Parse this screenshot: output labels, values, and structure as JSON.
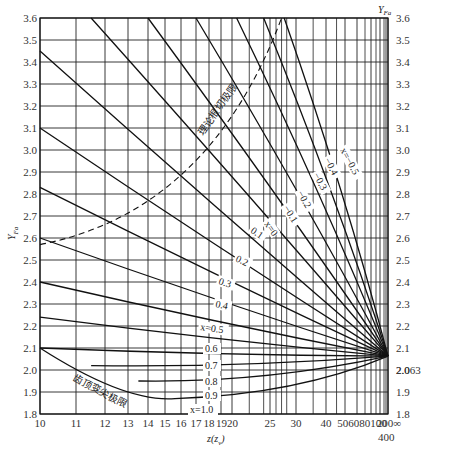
{
  "chart_data": {
    "type": "line",
    "title": "",
    "xlabel": "z(z_v)",
    "ylabel": "Y_Fa",
    "ylabel_right": "Y_Fa",
    "ylim": [
      1.8,
      3.6
    ],
    "yticks": [
      1.8,
      1.9,
      2.0,
      2.1,
      2.2,
      2.3,
      2.4,
      2.5,
      2.6,
      2.7,
      2.8,
      2.9,
      3.0,
      3.1,
      3.2,
      3.3,
      3.4,
      3.5,
      3.6
    ],
    "right_extra_tick": "2.063",
    "xticks": [
      {
        "label": "10",
        "x": 40
      },
      {
        "label": "11",
        "x": 76
      },
      {
        "label": "12",
        "x": 105
      },
      {
        "label": "13",
        "x": 128
      },
      {
        "label": "14",
        "x": 148
      },
      {
        "label": "15",
        "x": 165
      },
      {
        "label": "16",
        "x": 181
      },
      {
        "label": "17",
        "x": 196
      },
      {
        "label": "18",
        "x": 209
      },
      {
        "label": "19",
        "x": 221
      },
      {
        "label": "20",
        "x": 232
      },
      {
        "label": "25",
        "x": 270
      },
      {
        "label": "30",
        "x": 296
      },
      {
        "label": "40",
        "x": 326
      },
      {
        "label": "50",
        "x": 345
      },
      {
        "label": "60",
        "x": 357
      },
      {
        "label": "80",
        "x": 371
      },
      {
        "label": "100",
        "x": 380
      },
      {
        "label": "200",
        "x": 386
      },
      {
        "label": "∞",
        "x": 388
      }
    ],
    "xtick_labels_display": [
      "10",
      "11",
      "12",
      "13",
      "14",
      "15",
      "16",
      "17",
      "18",
      "1920",
      "25",
      "30",
      "40",
      "506080100",
      "200∞",
      "400"
    ],
    "grid": true,
    "convergence_point": {
      "z": "∞",
      "Y": 2.063
    },
    "series": [
      {
        "name": "x=-0.5",
        "start": {
          "z": 27.5,
          "Y": 3.6
        },
        "end": {
          "Y": 2.063
        }
      },
      {
        "name": "-0.4",
        "start": {
          "z": 24,
          "Y": 3.6
        },
        "end": {
          "Y": 2.063
        }
      },
      {
        "name": "-0.3",
        "start": {
          "z": 20.5,
          "Y": 3.6
        },
        "end": {
          "Y": 2.063
        }
      },
      {
        "name": "-0.2",
        "start": {
          "z": 17,
          "Y": 3.6
        },
        "end": {
          "Y": 2.063
        }
      },
      {
        "name": "-0.1",
        "start": {
          "z": 14,
          "Y": 3.6
        },
        "end": {
          "Y": 2.063
        }
      },
      {
        "name": "x=0",
        "start": {
          "z": 11.5,
          "Y": 3.6
        },
        "end": {
          "Y": 2.063
        }
      },
      {
        "name": "0.1",
        "start": {
          "z": 10,
          "Y": 3.45
        },
        "end": {
          "Y": 2.063
        }
      },
      {
        "name": "0.2",
        "start": {
          "z": 10,
          "Y": 3.1
        },
        "end": {
          "Y": 2.063
        }
      },
      {
        "name": "0.3",
        "start": {
          "z": 10,
          "Y": 2.83
        },
        "end": {
          "Y": 2.063
        }
      },
      {
        "name": "0.4",
        "start": {
          "z": 10,
          "Y": 2.6
        },
        "end": {
          "Y": 2.063
        }
      },
      {
        "name": "x=0.5",
        "start": {
          "z": 10,
          "Y": 2.4
        },
        "end": {
          "Y": 2.063
        }
      },
      {
        "name": "0.6",
        "start": {
          "z": 10,
          "Y": 2.24
        },
        "end": {
          "Y": 2.063
        }
      },
      {
        "name": "0.7",
        "start": {
          "z": 10,
          "Y": 2.1
        },
        "end": {
          "Y": 2.063
        }
      },
      {
        "name": "0.8",
        "start": {
          "z": 11.5,
          "Y": 2.02
        },
        "end": {
          "Y": 2.063
        }
      },
      {
        "name": "0.9",
        "start": {
          "z": 13.5,
          "Y": 1.95
        },
        "end": {
          "Y": 2.063
        }
      },
      {
        "name": "x=1.0",
        "start": {
          "z": 15,
          "Y": 1.87
        },
        "end": {
          "Y": 2.063
        }
      }
    ],
    "annotations": [
      {
        "text": "理论根切极限",
        "type": "dashed-curve",
        "from": {
          "z": 10,
          "Y": 2.57
        },
        "to": {
          "z": 27,
          "Y": 3.6
        }
      },
      {
        "text": "齿顶变尖极限",
        "type": "solid-curve",
        "from": {
          "z": 10,
          "Y": 2.1
        },
        "to": {
          "z": 15.5,
          "Y": 1.87
        }
      }
    ]
  },
  "labels": {
    "ylabel": "Y",
    "ylabel_sub": "Fa",
    "ylabel_right": "Y",
    "ylabel_right_sub": "Fa",
    "xlabel": "z(z",
    "xlabel_sub": "v",
    "xlabel_close": ")",
    "undercut": "理论根切极限",
    "tip": "齿顶变尖极限",
    "right_2063": "2.063",
    "x400": "400"
  }
}
